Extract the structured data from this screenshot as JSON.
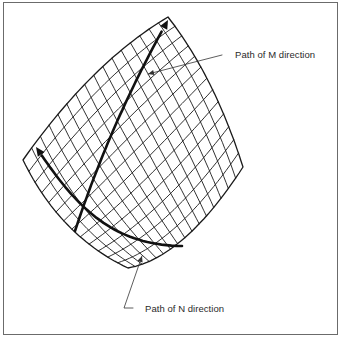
{
  "figure": {
    "labels": {
      "m_direction": "Path of M direction",
      "n_direction": "Path of N direction"
    },
    "colors": {
      "mesh": "#1a1a1a",
      "path": "#111111",
      "leader": "#333333",
      "frame": "#6b6b6b"
    },
    "mesh": {
      "rows": 13,
      "cols": 16,
      "corners": {
        "top": [
          168,
          17
        ],
        "left": [
          23,
          160
        ],
        "bottom": [
          128,
          268
        ],
        "right": [
          243,
          167
        ]
      },
      "bulge": {
        "top_left_edge": [
          92,
          62
        ],
        "bottom_left_edge": [
          60,
          236
        ],
        "bottom_right_edge": [
          184,
          258
        ],
        "top_right_edge": [
          214,
          76
        ]
      }
    },
    "paths": {
      "m": {
        "points": [
          [
            75,
            231
          ],
          [
            105,
            140
          ],
          [
            140,
            70
          ],
          [
            168,
            20
          ]
        ]
      },
      "n": {
        "points": [
          [
            36,
            147
          ],
          [
            75,
            205
          ],
          [
            110,
            245
          ],
          [
            182,
            246
          ]
        ]
      }
    },
    "leaders": {
      "m": {
        "from": [
          148,
          74
        ],
        "to": [
          222,
          55
        ]
      },
      "n": {
        "from": [
          142,
          256
        ],
        "to": [
          124,
          308
        ],
        "tail": [
          133,
          308
        ]
      }
    }
  }
}
